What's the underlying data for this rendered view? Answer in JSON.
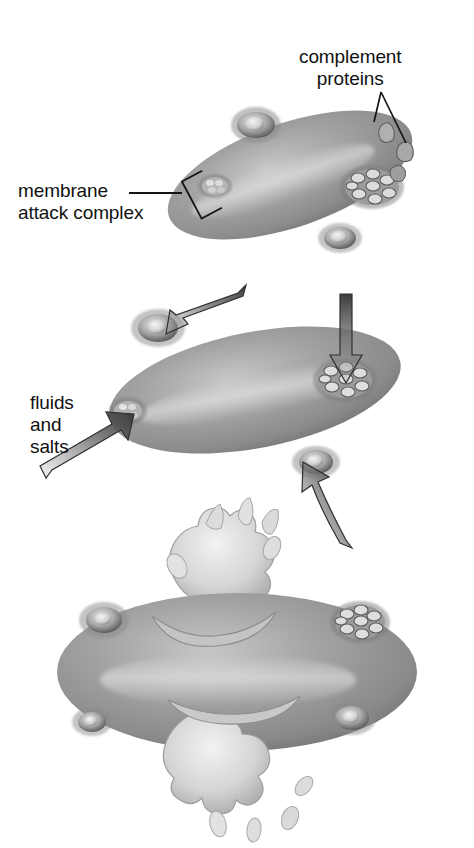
{
  "figure": {
    "background_color": "#ffffff",
    "ink_color": "#111111",
    "cell_color": "#9a9a9a",
    "cell_shadow_color": "#5f5f5f",
    "cell_highlight_color": "#cfcfcf",
    "splash_color": "#d9d9d9",
    "arrow_color": "#6b6b6b"
  },
  "labels": {
    "complement_proteins": "complement\nproteins",
    "membrane_attack_complex": "membrane\nattack complex",
    "fluids_and_salts": "fluids\nand\nsalts"
  },
  "stages": [
    {
      "name": "stage-1-binding",
      "caption_refs": [
        "complement_proteins",
        "membrane_attack_complex"
      ],
      "description": "Rod-shaped bacterium with complement proteins docking and pores forming",
      "pore_count": 4,
      "free_protein_count": 2
    },
    {
      "name": "stage-2-influx",
      "caption_refs": [
        "fluids_and_salts"
      ],
      "description": "Bacterium with completed pores; arrows show fluids and salts entering",
      "pore_count": 4,
      "arrow_count": 4
    },
    {
      "name": "stage-3-lysis",
      "caption_refs": [],
      "description": "Swollen bacterium bursting, cytoplasm erupting from two ruptures",
      "pore_count": 4,
      "burst_count": 2
    }
  ],
  "icons": {
    "pore": "pore-ring-icon",
    "rosette_pore": "rosette-pore-icon",
    "complement_protein": "complement-protein-icon",
    "bracket_leader": "bracket-leader-icon",
    "arrow": "influx-arrow-icon",
    "burst": "lysis-burst-icon"
  }
}
